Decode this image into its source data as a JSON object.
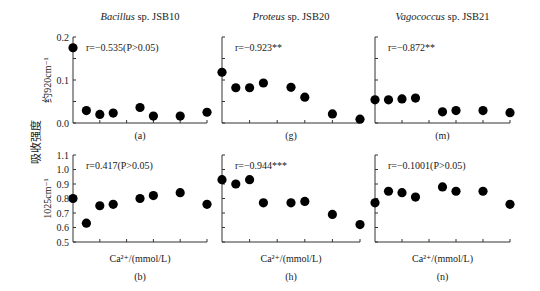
{
  "figure": {
    "shared_ylabel": "吸收强度",
    "row_ylabels": [
      "约920cm⁻¹",
      "1025cm⁻¹"
    ],
    "xlabel": "Ca²⁺/(mmol/L)"
  },
  "chart_data": [
    {
      "id": "a",
      "panel_label": "(a)",
      "type": "scatter",
      "title_italic": "Bacillus",
      "title_rest": " sp. JSB10",
      "annotation": "r=−0.535(P>0.05)",
      "ylabel": "约920cm⁻¹",
      "xlabel": "",
      "ylim": [
        0.0,
        0.2
      ],
      "yticks": [
        "0.0",
        "0.1",
        "0.2"
      ],
      "x": [
        0,
        0.5,
        1,
        1.5,
        2.5,
        3,
        4,
        5
      ],
      "y": [
        0.175,
        0.029,
        0.02,
        0.023,
        0.036,
        0.016,
        0.016,
        0.025
      ]
    },
    {
      "id": "g",
      "panel_label": "(g)",
      "type": "scatter",
      "title_italic": "Proteus",
      "title_rest": " sp. JSB20",
      "annotation": "r=−0.923**",
      "ylabel": "",
      "xlabel": "",
      "ylim": [
        0.0,
        0.2
      ],
      "yticks": [],
      "x": [
        0,
        0.5,
        1,
        1.5,
        2.5,
        3,
        4,
        5
      ],
      "y": [
        0.118,
        0.082,
        0.082,
        0.093,
        0.083,
        0.06,
        0.021,
        0.009
      ]
    },
    {
      "id": "m",
      "panel_label": "(m)",
      "type": "scatter",
      "title_italic": "Vagococcus",
      "title_rest": " sp. JSB21",
      "annotation": "r=−0.872**",
      "ylabel": "",
      "xlabel": "",
      "ylim": [
        0.0,
        0.2
      ],
      "yticks": [],
      "x": [
        0,
        0.5,
        1,
        1.5,
        2.5,
        3,
        4,
        5
      ],
      "y": [
        0.054,
        0.054,
        0.056,
        0.058,
        0.026,
        0.029,
        0.029,
        0.024
      ]
    },
    {
      "id": "b",
      "panel_label": "(b)",
      "type": "scatter",
      "title_italic": "",
      "title_rest": "",
      "annotation": "r=0.417(P>0.05)",
      "ylabel": "1025cm⁻¹",
      "xlabel": "Ca²⁺/(mmol/L)",
      "ylim": [
        0.5,
        1.1
      ],
      "yticks": [
        "0.5",
        "0.6",
        "0.7",
        "0.8",
        "0.9",
        "1.0",
        "1.1"
      ],
      "x": [
        0,
        0.5,
        1,
        1.5,
        2.5,
        3,
        4,
        5
      ],
      "y": [
        0.8,
        0.63,
        0.75,
        0.76,
        0.8,
        0.82,
        0.84,
        0.76
      ]
    },
    {
      "id": "h",
      "panel_label": "(h)",
      "type": "scatter",
      "title_italic": "",
      "title_rest": "",
      "annotation": "r=−0.944***",
      "ylabel": "",
      "xlabel": "Ca²⁺/(mmol/L)",
      "ylim": [
        0.5,
        1.1
      ],
      "yticks": [],
      "x": [
        0,
        0.5,
        1,
        1.5,
        2.5,
        3,
        4,
        5
      ],
      "y": [
        0.93,
        0.9,
        0.93,
        0.77,
        0.77,
        0.78,
        0.69,
        0.62
      ]
    },
    {
      "id": "n",
      "panel_label": "(n)",
      "type": "scatter",
      "title_italic": "",
      "title_rest": "",
      "annotation": "r=−0.1001(P>0.05)",
      "ylabel": "",
      "xlabel": "Ca²⁺/(mmol/L)",
      "ylim": [
        0.5,
        1.1
      ],
      "yticks": [],
      "x": [
        0,
        0.5,
        1,
        1.5,
        2.5,
        3,
        4,
        5
      ],
      "y": [
        0.77,
        0.85,
        0.84,
        0.81,
        0.88,
        0.85,
        0.85,
        0.76
      ]
    }
  ]
}
